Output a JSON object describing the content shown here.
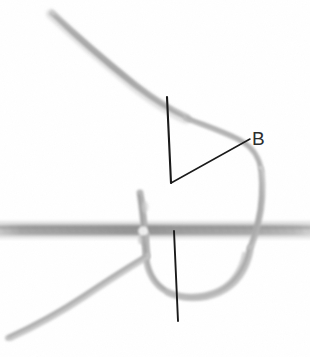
{
  "figure": {
    "kind": "photograph-suture-knot",
    "alt_description": "Grayscale close-up photograph of a thread or suture passing through a horizontal fabric strand, forming a loop, with hand-drawn annotation lines marking an angle labeled B",
    "background_color": "#ffffff",
    "width": 310,
    "height": 357
  },
  "annotations": {
    "label_b": "B",
    "label_color": "#2c2c2c",
    "line_color": "#1a1a1a",
    "items": [
      {
        "name": "upper-vertical-line",
        "x1": 167,
        "y1": 97,
        "x2": 171,
        "y2": 183
      },
      {
        "name": "leader-line-to-b",
        "x1": 171,
        "y1": 183,
        "x2": 250,
        "y2": 139
      },
      {
        "name": "lower-vertical-line",
        "x1": 174,
        "y1": 231,
        "x2": 178,
        "y2": 321
      }
    ]
  },
  "photo_elements": {
    "horizontal_band": {
      "name": "fabric-strand",
      "y_center": 230,
      "thickness": 11,
      "color": "#9a9a9a",
      "span": "full-width"
    },
    "threads": [
      {
        "name": "upper-left-thread-tail",
        "color": "#b4b4b4"
      },
      {
        "name": "upper-descending-thread",
        "color": "#bdbdbd"
      },
      {
        "name": "right-loop-thread",
        "color": "#b8b8b8"
      },
      {
        "name": "lower-u-loop-thread",
        "color": "#b0b0b0"
      },
      {
        "name": "lower-left-thread-tail",
        "color": "#bcbcbc"
      },
      {
        "name": "knot-crossing-thread",
        "color": "#a8a8a8"
      }
    ]
  }
}
